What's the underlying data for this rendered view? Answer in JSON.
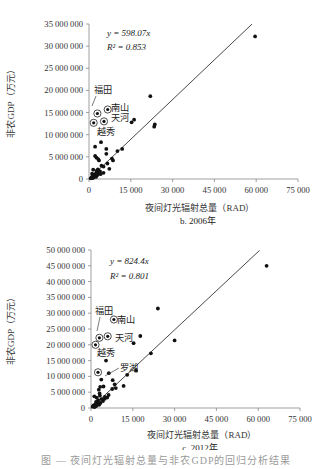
{
  "chart_data": [
    {
      "type": "scatter",
      "panel_label": "b. 2006年",
      "xlabel": "夜间灯光辐射总量（RAD）",
      "ylabel": "非农GDP（万元）",
      "xlim": [
        0,
        75000
      ],
      "ylim": [
        0,
        35000000
      ],
      "x_ticks": [
        "0",
        "15 000",
        "30 000",
        "45 000",
        "60 000",
        "75 000"
      ],
      "y_ticks": [
        "0",
        "5 000 000",
        "10 000 000",
        "15 000 000",
        "20 000 000",
        "25 000 000",
        "30 000 000",
        "35 000 000"
      ],
      "regression": {
        "equation": "y = 598.07x",
        "slope": 598.07,
        "r2_label": "R² = 0.853",
        "r2": 0.853,
        "x_end": 58500
      },
      "grid": false,
      "labeled_points": [
        {
          "name": "福田",
          "x": 3000,
          "y": 14800000
        },
        {
          "name": "南山",
          "x": 6700,
          "y": 15700000
        },
        {
          "name": "天河",
          "x": 5400,
          "y": 13000000
        },
        {
          "name": "越秀",
          "x": 1700,
          "y": 12700000
        }
      ],
      "points": [
        [
          59600,
          32200000
        ],
        [
          22000,
          18700000
        ],
        [
          16200,
          13400000
        ],
        [
          15300,
          12800000
        ],
        [
          23600,
          12300000
        ],
        [
          23400,
          11800000
        ],
        [
          4300,
          8300000
        ],
        [
          2200,
          7300000
        ],
        [
          6200,
          6800000
        ],
        [
          11900,
          6800000
        ],
        [
          10200,
          6300000
        ],
        [
          6200,
          5700000
        ],
        [
          2200,
          5200000
        ],
        [
          2700,
          4800000
        ],
        [
          3300,
          4500000
        ],
        [
          3600,
          4200000
        ],
        [
          8200,
          4600000
        ],
        [
          8600,
          4200000
        ],
        [
          6600,
          3500000
        ],
        [
          4500,
          3000000
        ],
        [
          7300,
          2300000
        ],
        [
          5200,
          2800000
        ],
        [
          3200,
          2200000
        ],
        [
          1500,
          2100000
        ],
        [
          2800,
          1900000
        ],
        [
          4000,
          1700000
        ],
        [
          3400,
          1500000
        ],
        [
          2500,
          1300000
        ],
        [
          3800,
          1200000
        ],
        [
          2000,
          1000000
        ],
        [
          3000,
          900000
        ],
        [
          1600,
          800000
        ],
        [
          2300,
          700000
        ],
        [
          1200,
          600000
        ],
        [
          2600,
          500000
        ],
        [
          1800,
          400000
        ],
        [
          900,
          300000
        ],
        [
          1400,
          200000
        ],
        [
          600,
          150000
        ],
        [
          4200,
          1100000
        ],
        [
          5200,
          1400000
        ],
        [
          2900,
          1600000
        ],
        [
          1100,
          1200000
        ]
      ]
    },
    {
      "type": "scatter",
      "panel_label": "c. 2012年",
      "xlabel": "夜间灯光辐射总量（RAD）",
      "ylabel": "非农GDP（万元）",
      "xlim": [
        0,
        75000
      ],
      "ylim": [
        0,
        50000000
      ],
      "x_ticks": [
        "0",
        "15 000",
        "30 000",
        "45 000",
        "60 000",
        "75 000"
      ],
      "y_ticks": [
        "0",
        "5 000 000",
        "10 000 000",
        "15 000 000",
        "20 000 000",
        "25 000 000",
        "30 000 000",
        "35 000 000",
        "40 000 000",
        "45 000 000",
        "50 000 000"
      ],
      "regression": {
        "equation": "y = 824.4x",
        "slope": 824.4,
        "r2_label": "R² = 0.801",
        "r2": 0.801,
        "x_end": 60500
      },
      "grid": false,
      "labeled_points": [
        {
          "name": "福田",
          "x": 3000,
          "y": 22200000
        },
        {
          "name": "南山",
          "x": 8200,
          "y": 28000000
        },
        {
          "name": "天河",
          "x": 6000,
          "y": 22700000
        },
        {
          "name": "越秀",
          "x": 1600,
          "y": 20000000
        },
        {
          "name": "罗湖",
          "x": 2500,
          "y": 11300000
        }
      ],
      "points": [
        [
          63000,
          45000000
        ],
        [
          24000,
          31500000
        ],
        [
          17700,
          22800000
        ],
        [
          15300,
          20500000
        ],
        [
          30000,
          21400000
        ],
        [
          21500,
          17300000
        ],
        [
          5400,
          15000000
        ],
        [
          16200,
          11800000
        ],
        [
          13000,
          10500000
        ],
        [
          6400,
          11000000
        ],
        [
          3700,
          9000000
        ],
        [
          7800,
          8800000
        ],
        [
          8500,
          7500000
        ],
        [
          8900,
          6300000
        ],
        [
          11700,
          7000000
        ],
        [
          3300,
          6700000
        ],
        [
          4500,
          6800000
        ],
        [
          2800,
          5800000
        ],
        [
          7600,
          6000000
        ],
        [
          6300,
          4100000
        ],
        [
          5000,
          3500000
        ],
        [
          3200,
          3900000
        ],
        [
          2000,
          3300000
        ],
        [
          1200,
          3700000
        ],
        [
          3800,
          2800000
        ],
        [
          2600,
          2500000
        ],
        [
          4300,
          2200000
        ],
        [
          1800,
          1900000
        ],
        [
          3400,
          1600000
        ],
        [
          2300,
          1400000
        ],
        [
          1500,
          1100000
        ],
        [
          2900,
          1000000
        ],
        [
          900,
          800000
        ],
        [
          1900,
          600000
        ],
        [
          600,
          400000
        ],
        [
          1300,
          300000
        ],
        [
          4900,
          2900000
        ],
        [
          5800,
          3300000
        ],
        [
          3100,
          4600000
        ],
        [
          2400,
          2100000
        ]
      ]
    }
  ],
  "figure_caption": "图 — 夜间灯光辐射总量与非农GDP的回归分析结果"
}
